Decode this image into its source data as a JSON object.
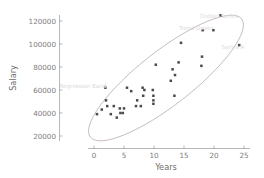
{
  "chart_data": {
    "type": "scatter",
    "title": "",
    "xlabel": "Years",
    "ylabel": "Salary",
    "xlim": [
      -5,
      26
    ],
    "ylim": [
      8000,
      132000
    ],
    "grid": false,
    "legend": null,
    "xticks": [
      "0",
      "5",
      "10",
      "15",
      "20",
      "25"
    ],
    "xtick_values": [
      0,
      5,
      10,
      15,
      20,
      25
    ],
    "yticks": [
      "20000",
      "40000",
      "60000",
      "80000",
      "100000",
      "120000"
    ],
    "ytick_values": [
      20000,
      40000,
      60000,
      80000,
      100000,
      120000
    ],
    "x": [
      0.5,
      1.3,
      1.9,
      2.0,
      2.2,
      2.8,
      3.3,
      3.8,
      4.3,
      4.4,
      4.8,
      5.0,
      5.5,
      6.2,
      7.0,
      7.2,
      7.8,
      8.1,
      8.2,
      8.4,
      9.8,
      9.9,
      9.9,
      9.9,
      10.3,
      12.8,
      13.1,
      13.4,
      13.5,
      14.1,
      14.5,
      17.9,
      18.0,
      18.1,
      19.9,
      21.1,
      24.2
    ],
    "y": [
      39000,
      43000,
      62000,
      51000,
      46000,
      39000,
      46000,
      36000,
      44000,
      40000,
      40000,
      44000,
      62000,
      59000,
      46000,
      51000,
      46000,
      62000,
      55000,
      60000,
      60000,
      55000,
      51000,
      48000,
      82000,
      68000,
      78000,
      55000,
      73000,
      84000,
      101000,
      81000,
      89000,
      112000,
      112000,
      125000,
      99000
    ],
    "points": [
      {
        "years": 0.5,
        "salary": 39000
      },
      {
        "years": 1.3,
        "salary": 43000
      },
      {
        "years": 1.9,
        "salary": 62000
      },
      {
        "years": 2.0,
        "salary": 51000
      },
      {
        "years": 2.2,
        "salary": 46000
      },
      {
        "years": 2.8,
        "salary": 39000
      },
      {
        "years": 3.3,
        "salary": 46000
      },
      {
        "years": 3.8,
        "salary": 36000
      },
      {
        "years": 4.3,
        "salary": 44000
      },
      {
        "years": 4.4,
        "salary": 40000
      },
      {
        "years": 4.8,
        "salary": 40000
      },
      {
        "years": 5.0,
        "salary": 44000
      },
      {
        "years": 5.5,
        "salary": 62000
      },
      {
        "years": 6.2,
        "salary": 59000
      },
      {
        "years": 7.0,
        "salary": 46000
      },
      {
        "years": 7.2,
        "salary": 51000
      },
      {
        "years": 7.8,
        "salary": 46000
      },
      {
        "years": 8.1,
        "salary": 62000
      },
      {
        "years": 8.2,
        "salary": 55000
      },
      {
        "years": 8.4,
        "salary": 60000
      },
      {
        "years": 9.8,
        "salary": 60000
      },
      {
        "years": 9.9,
        "salary": 55000
      },
      {
        "years": 9.9,
        "salary": 51000
      },
      {
        "years": 9.9,
        "salary": 48000
      },
      {
        "years": 10.3,
        "salary": 82000
      },
      {
        "years": 12.8,
        "salary": 68000
      },
      {
        "years": 13.1,
        "salary": 78000
      },
      {
        "years": 13.4,
        "salary": 55000
      },
      {
        "years": 13.5,
        "salary": 73000
      },
      {
        "years": 14.1,
        "salary": 84000
      },
      {
        "years": 14.5,
        "salary": 101000
      },
      {
        "years": 17.9,
        "salary": 81000
      },
      {
        "years": 18.0,
        "salary": 89000
      },
      {
        "years": 18.1,
        "salary": 112000
      },
      {
        "years": 19.9,
        "salary": 112000
      },
      {
        "years": 21.1,
        "salary": 125000
      },
      {
        "years": 24.2,
        "salary": 99000
      }
    ],
    "annotations": [
      {
        "id": "annotation-upper-right",
        "text": "Outlier Series",
        "x_px": 219,
        "y_px": 18
      },
      {
        "id": "annotation-mid-right",
        "text": "Trend Upper",
        "x_px": 196,
        "y_px": 30
      },
      {
        "id": "annotation-far-right",
        "text": "Series A",
        "x_px": 233,
        "y_px": 49
      },
      {
        "id": "annotation-left",
        "text": "Regression Band",
        "x_px": 83,
        "y_px": 88
      }
    ],
    "overlay": {
      "name": "confidence-ellipse",
      "cx_px": 166,
      "cy_px": 78,
      "rx_px": 96,
      "ry_px": 27,
      "rotation_deg": -38,
      "color": "#b0a0a8"
    },
    "colors": {
      "marker": "#4a4a4a",
      "axis": "#9a9a9a",
      "tick_text": "#7d7d7d",
      "axis_title": "#6e6e6e",
      "annotation_text": "#d9d9d9",
      "background": "#ffffff"
    }
  }
}
